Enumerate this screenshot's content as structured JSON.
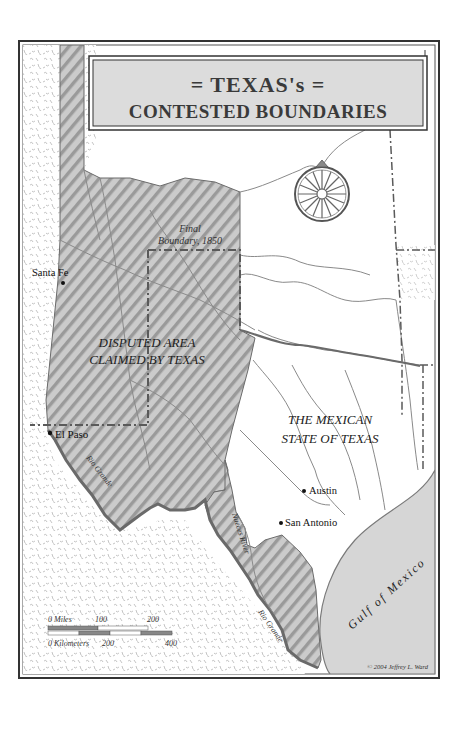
{
  "title": {
    "line1": "= TEXAS's =",
    "line2": "CONTESTED BOUNDARIES"
  },
  "regions": {
    "disputed": {
      "line1": "DISPUTED AREA",
      "line2": "CLAIMED BY TEXAS"
    },
    "mexican_texas": {
      "line1": "THE MEXICAN",
      "line2": "STATE OF TEXAS"
    },
    "gulf": "Gulf of Mexico"
  },
  "boundary_label": {
    "line1": "Final",
    "line2": "Boundary, 1850"
  },
  "cities": [
    {
      "name": "Santa Fe"
    },
    {
      "name": "El Paso"
    },
    {
      "name": "Austin"
    },
    {
      "name": "San Antonio"
    }
  ],
  "rivers": {
    "rio_grande_upper": "Rio Grande",
    "rio_grande_lower": "Rio Grande",
    "nueces": "Nueces River"
  },
  "scale_bar": {
    "miles_label": "0  Miles",
    "miles_ticks": [
      "100",
      "200"
    ],
    "km_label": "0  Kilometers",
    "km_ticks": [
      "200",
      "400"
    ]
  },
  "copyright": "© 2004 Jeffrey L. Ward",
  "colors": {
    "hatch_fill": "#c9c9c9",
    "hatch_stripe": "#8f8f8f",
    "gulf": "#d4d4d4",
    "border": "#555555",
    "frame": "#333333"
  }
}
